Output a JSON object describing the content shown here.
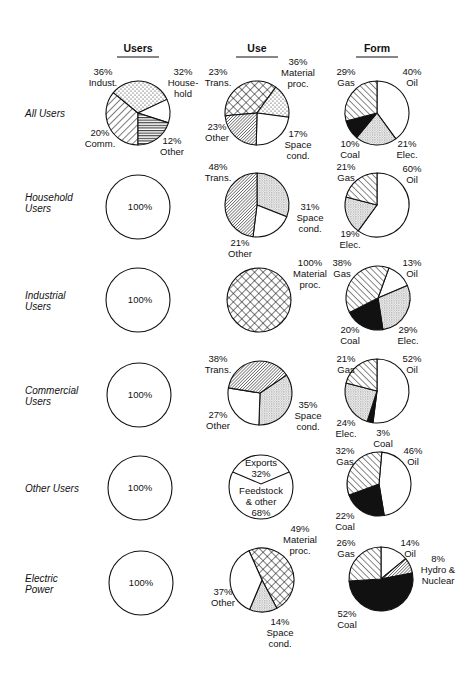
{
  "columns": [
    {
      "key": "users",
      "label": "Users",
      "x": 138
    },
    {
      "key": "use",
      "label": "Use",
      "x": 257
    },
    {
      "key": "form",
      "label": "Form",
      "x": 377
    }
  ],
  "rows": [
    {
      "label": [
        "All Users"
      ],
      "y": 113
    },
    {
      "label": [
        "Household",
        "Users"
      ],
      "y": 202
    },
    {
      "label": [
        "Industrial",
        "Users"
      ],
      "y": 300
    },
    {
      "label": [
        "Commercial",
        "Users"
      ],
      "y": 395
    },
    {
      "label": [
        "Other Users"
      ],
      "y": 488
    },
    {
      "label": [
        "Electric",
        "Power"
      ],
      "y": 583
    }
  ],
  "chart_data": {
    "type": "pie",
    "title": "",
    "column_headers": [
      "Users",
      "Use",
      "Form"
    ],
    "row_headers": [
      "All Users",
      "Household Users",
      "Industrial Users",
      "Commercial Users",
      "Other Users",
      "Electric Power"
    ],
    "pies": [
      {
        "id": "all-users-users",
        "row": "All Users",
        "column": "Users",
        "cx": 138,
        "cy": 113,
        "r": 32,
        "start": 180,
        "slices": [
          {
            "name": "Indust.",
            "value": 36,
            "pattern": "diag-fwd",
            "label": [
              "36%",
              "Indust."
            ],
            "lx": 103,
            "ly": 75,
            "anchor": "middle"
          },
          {
            "name": "Household",
            "value": 32,
            "pattern": "dots",
            "label": [
              "32%",
              "House-",
              "hold"
            ],
            "lx": 183,
            "ly": 75,
            "anchor": "middle"
          },
          {
            "name": "Other",
            "value": 12,
            "pattern": "white",
            "label": [
              "12%",
              "Other"
            ],
            "lx": 172,
            "ly": 144,
            "anchor": "middle"
          },
          {
            "name": "Comm.",
            "value": 20,
            "pattern": "hlines",
            "label": [
              "20%",
              "Comm."
            ],
            "lx": 100,
            "ly": 136,
            "anchor": "middle"
          }
        ]
      },
      {
        "id": "all-users-use",
        "row": "All Users",
        "column": "Use",
        "cx": 257,
        "cy": 113,
        "r": 32,
        "start": 265,
        "slices": [
          {
            "name": "Material proc.",
            "value": 36,
            "pattern": "crosshatch",
            "label": [
              "36%",
              "Material",
              "proc."
            ],
            "lx": 298,
            "ly": 65,
            "anchor": "middle"
          },
          {
            "name": "Space cond.",
            "value": 17,
            "pattern": "dots",
            "label": [
              "17%",
              "Space",
              "cond."
            ],
            "lx": 298,
            "ly": 137,
            "anchor": "middle"
          },
          {
            "name": "Other",
            "value": 23,
            "pattern": "white",
            "label": [
              "23%",
              "Other"
            ],
            "lx": 217,
            "ly": 130,
            "anchor": "middle"
          },
          {
            "name": "Trans.",
            "value": 23,
            "pattern": "dense-diag",
            "label": [
              "23%",
              "Trans."
            ],
            "lx": 218,
            "ly": 75,
            "anchor": "middle"
          }
        ]
      },
      {
        "id": "all-users-form",
        "row": "All Users",
        "column": "Form",
        "cx": 377,
        "cy": 113,
        "r": 32,
        "start": 0,
        "slices": [
          {
            "name": "Oil",
            "value": 40,
            "pattern": "white",
            "label": [
              "40%",
              "Oil"
            ],
            "lx": 412,
            "ly": 75,
            "anchor": "middle"
          },
          {
            "name": "Elec.",
            "value": 21,
            "pattern": "fine-dots",
            "label": [
              "21%",
              "Elec."
            ],
            "lx": 407,
            "ly": 147,
            "anchor": "middle"
          },
          {
            "name": "Coal",
            "value": 10,
            "pattern": "black",
            "label": [
              "10%",
              "Coal"
            ],
            "lx": 350,
            "ly": 147,
            "anchor": "middle"
          },
          {
            "name": "Gas",
            "value": 29,
            "pattern": "diag-back",
            "label": [
              "29%",
              "Gas"
            ],
            "lx": 346,
            "ly": 75,
            "anchor": "middle"
          }
        ]
      },
      {
        "id": "household-users",
        "row": "Household Users",
        "column": "Users",
        "cx": 138,
        "cy": 207,
        "r": 32,
        "start": 0,
        "slices": [
          {
            "name": "Household",
            "value": 100,
            "pattern": "white",
            "label": [
              "100%"
            ],
            "lx": 140,
            "ly": 210,
            "anchor": "middle"
          }
        ]
      },
      {
        "id": "household-use",
        "row": "Household Users",
        "column": "Use",
        "cx": 257,
        "cy": 205,
        "r": 32,
        "start": 0,
        "slices": [
          {
            "name": "Space cond.",
            "value": 31,
            "pattern": "fine-dots",
            "label": [
              "31%",
              "Space",
              "cond."
            ],
            "lx": 310,
            "ly": 210,
            "anchor": "middle"
          },
          {
            "name": "Other",
            "value": 21,
            "pattern": "white",
            "label": [
              "21%",
              "Other"
            ],
            "lx": 240,
            "ly": 246,
            "anchor": "middle"
          },
          {
            "name": "Trans.",
            "value": 48,
            "pattern": "dense-diag",
            "label": [
              "48%",
              "Trans."
            ],
            "lx": 218,
            "ly": 170,
            "anchor": "middle"
          }
        ]
      },
      {
        "id": "household-form",
        "row": "Household Users",
        "column": "Form",
        "cx": 377,
        "cy": 205,
        "r": 32,
        "start": 0,
        "slices": [
          {
            "name": "Oil",
            "value": 60,
            "pattern": "white",
            "label": [
              "60%",
              "Oil"
            ],
            "lx": 412,
            "ly": 172,
            "anchor": "middle"
          },
          {
            "name": "Elec.",
            "value": 19,
            "pattern": "fine-dots",
            "label": [
              "19%",
              "Elec."
            ],
            "lx": 350,
            "ly": 237,
            "anchor": "middle"
          },
          {
            "name": "Gas",
            "value": 21,
            "pattern": "diag-back",
            "label": [
              "21%",
              "Gas"
            ],
            "lx": 346,
            "ly": 170,
            "anchor": "middle"
          }
        ]
      },
      {
        "id": "industrial-users",
        "row": "Industrial Users",
        "column": "Users",
        "cx": 138,
        "cy": 300,
        "r": 32,
        "start": 0,
        "slices": [
          {
            "name": "Industrial",
            "value": 100,
            "pattern": "white",
            "label": [
              "100%"
            ],
            "lx": 140,
            "ly": 303,
            "anchor": "middle"
          }
        ]
      },
      {
        "id": "industrial-use",
        "row": "Industrial Users",
        "column": "Use",
        "cx": 259,
        "cy": 300,
        "r": 32,
        "start": 0,
        "slices": [
          {
            "name": "Material proc.",
            "value": 100,
            "pattern": "crosshatch",
            "label": [
              "100%",
              "Material",
              "proc."
            ],
            "lx": 310,
            "ly": 266,
            "anchor": "middle"
          }
        ]
      },
      {
        "id": "industrial-form",
        "row": "Industrial Users",
        "column": "Form",
        "cx": 378,
        "cy": 298,
        "r": 32,
        "start": 20,
        "slices": [
          {
            "name": "Oil",
            "value": 13,
            "pattern": "white",
            "label": [
              "13%",
              "Oil"
            ],
            "lx": 412,
            "ly": 266,
            "anchor": "middle"
          },
          {
            "name": "Elec.",
            "value": 29,
            "pattern": "fine-dots",
            "label": [
              "29%",
              "Elec."
            ],
            "lx": 408,
            "ly": 333,
            "anchor": "middle"
          },
          {
            "name": "Coal",
            "value": 20,
            "pattern": "black",
            "label": [
              "20%",
              "Coal"
            ],
            "lx": 350,
            "ly": 333,
            "anchor": "middle"
          },
          {
            "name": "Gas",
            "value": 38,
            "pattern": "diag-back",
            "label": [
              "38%",
              "Gas"
            ],
            "lx": 342,
            "ly": 266,
            "anchor": "middle"
          }
        ]
      },
      {
        "id": "commercial-users",
        "row": "Commercial Users",
        "column": "Users",
        "cx": 139,
        "cy": 395,
        "r": 32,
        "start": 0,
        "slices": [
          {
            "name": "Commercial",
            "value": 100,
            "pattern": "white",
            "label": [
              "100%"
            ],
            "lx": 140,
            "ly": 398,
            "anchor": "middle"
          }
        ]
      },
      {
        "id": "commercial-use",
        "row": "Commercial Users",
        "column": "Use",
        "cx": 260,
        "cy": 393,
        "r": 32,
        "start": 56,
        "slices": [
          {
            "name": "Space cond.",
            "value": 35,
            "pattern": "fine-dots",
            "label": [
              "35%",
              "Space",
              "cond."
            ],
            "lx": 308,
            "ly": 408,
            "anchor": "middle"
          },
          {
            "name": "Other",
            "value": 27,
            "pattern": "white",
            "label": [
              "27%",
              "Other"
            ],
            "lx": 218,
            "ly": 418,
            "anchor": "middle"
          },
          {
            "name": "Trans.",
            "value": 38,
            "pattern": "dense-diag",
            "label": [
              "38%",
              "Trans."
            ],
            "lx": 218,
            "ly": 362,
            "anchor": "middle"
          }
        ]
      },
      {
        "id": "commercial-form",
        "row": "Commercial Users",
        "column": "Form",
        "cx": 377,
        "cy": 391,
        "r": 32,
        "start": 0,
        "slices": [
          {
            "name": "Oil",
            "value": 52,
            "pattern": "white",
            "label": [
              "52%",
              "Oil"
            ],
            "lx": 412,
            "ly": 362,
            "anchor": "middle"
          },
          {
            "name": "Coal",
            "value": 3,
            "pattern": "black",
            "label": [
              "3%",
              "Coal"
            ],
            "lx": 383,
            "ly": 436,
            "anchor": "middle"
          },
          {
            "name": "Elec.",
            "value": 24,
            "pattern": "fine-dots",
            "label": [
              "24%",
              "Elec."
            ],
            "lx": 346,
            "ly": 426,
            "anchor": "middle"
          },
          {
            "name": "Gas",
            "value": 21,
            "pattern": "diag-back",
            "label": [
              "21%",
              "Gas"
            ],
            "lx": 346,
            "ly": 362,
            "anchor": "middle"
          }
        ]
      },
      {
        "id": "other-users",
        "row": "Other Users",
        "column": "Users",
        "cx": 140,
        "cy": 488,
        "r": 32,
        "start": 0,
        "slices": [
          {
            "name": "Other",
            "value": 100,
            "pattern": "white",
            "label": [
              "100%"
            ],
            "lx": 140,
            "ly": 491,
            "anchor": "middle"
          }
        ]
      },
      {
        "id": "other-use",
        "row": "Other Users",
        "column": "Use",
        "cx": 261,
        "cy": 487,
        "r": 32,
        "start": 0,
        "custom": "exports-feedstock",
        "slices": [
          {
            "name": "Exports",
            "value": 32,
            "pattern": "white",
            "label": [
              "Exports",
              "32%"
            ],
            "lx": 261,
            "ly": 466,
            "anchor": "middle"
          },
          {
            "name": "Feedstock & other",
            "value": 68,
            "pattern": "white",
            "label": [
              "Feedstock",
              "& other",
              "68%"
            ],
            "lx": 261,
            "ly": 494,
            "anchor": "middle"
          }
        ]
      },
      {
        "id": "other-form",
        "row": "Other Users",
        "column": "Form",
        "cx": 379,
        "cy": 484,
        "r": 32,
        "start": 5,
        "slices": [
          {
            "name": "Oil",
            "value": 46,
            "pattern": "white",
            "label": [
              "46%",
              "Oil"
            ],
            "lx": 413,
            "ly": 454,
            "anchor": "middle"
          },
          {
            "name": "Coal",
            "value": 22,
            "pattern": "black",
            "label": [
              "22%",
              "Coal"
            ],
            "lx": 345,
            "ly": 519,
            "anchor": "middle"
          },
          {
            "name": "Gas",
            "value": 32,
            "pattern": "diag-back",
            "label": [
              "32%",
              "Gas"
            ],
            "lx": 345,
            "ly": 454,
            "anchor": "middle"
          }
        ]
      },
      {
        "id": "electric-users",
        "row": "Electric Power",
        "column": "Users",
        "cx": 141,
        "cy": 583,
        "r": 32,
        "start": 0,
        "slices": [
          {
            "name": "Electric Power",
            "value": 100,
            "pattern": "white",
            "label": [
              "100%"
            ],
            "lx": 141,
            "ly": 586,
            "anchor": "middle"
          }
        ]
      },
      {
        "id": "electric-use",
        "row": "Electric Power",
        "column": "Use",
        "cx": 262,
        "cy": 580,
        "r": 32,
        "start": 336,
        "slices": [
          {
            "name": "Material proc.",
            "value": 49,
            "pattern": "crosshatch",
            "label": [
              "49%",
              "Material",
              "proc."
            ],
            "lx": 300,
            "ly": 532,
            "anchor": "middle"
          },
          {
            "name": "Space cond.",
            "value": 14,
            "pattern": "fine-dots",
            "label": [
              "14%",
              "Space",
              "cond."
            ],
            "lx": 280,
            "ly": 625,
            "anchor": "middle"
          },
          {
            "name": "Other",
            "value": 37,
            "pattern": "white",
            "label": [
              "37%",
              "Other"
            ],
            "lx": 223,
            "ly": 595,
            "anchor": "middle"
          }
        ]
      },
      {
        "id": "electric-form",
        "row": "Electric Power",
        "column": "Form",
        "cx": 381,
        "cy": 579,
        "r": 32,
        "start": 0,
        "slices": [
          {
            "name": "Oil",
            "value": 14,
            "pattern": "white",
            "label": [
              "14%",
              "Oil"
            ],
            "lx": 410,
            "ly": 546,
            "anchor": "middle"
          },
          {
            "name": "Hydro & Nuclear",
            "value": 8,
            "pattern": "dense-diag",
            "label": [
              "8%",
              "Hydro &",
              "Nuclear"
            ],
            "lx": 438,
            "ly": 562,
            "anchor": "middle"
          },
          {
            "name": "Coal",
            "value": 52,
            "pattern": "black",
            "label": [
              "52%",
              "Coal"
            ],
            "lx": 347,
            "ly": 617,
            "anchor": "middle"
          },
          {
            "name": "Gas",
            "value": 26,
            "pattern": "diag-back",
            "label": [
              "26%",
              "Gas"
            ],
            "lx": 346,
            "ly": 546,
            "anchor": "middle"
          }
        ]
      }
    ]
  }
}
